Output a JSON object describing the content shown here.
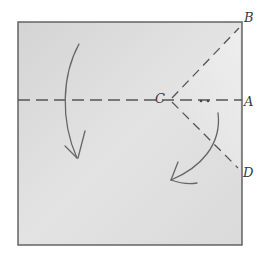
{
  "diagram": {
    "type": "origami-fold-diagram",
    "labels": {
      "a": "A",
      "b": "B",
      "c": "C",
      "d": "D"
    },
    "colors": {
      "paper": "#d9d9d9",
      "paper_light": "#ececec",
      "stroke": "#555555",
      "background": "#ffffff"
    },
    "fold_lines": [
      {
        "name": "horizontal-fold",
        "from": "left-edge",
        "to": "A",
        "style": "dashed"
      },
      {
        "name": "diagonal-fold-upper",
        "from": "C",
        "to": "B",
        "style": "dashed"
      },
      {
        "name": "diagonal-fold-lower",
        "from": "C",
        "to": "D",
        "style": "dashed"
      }
    ],
    "arrows": [
      {
        "name": "fold-down-arrow-left",
        "direction": "down"
      },
      {
        "name": "fold-down-arrow-right",
        "direction": "down-left"
      }
    ]
  }
}
